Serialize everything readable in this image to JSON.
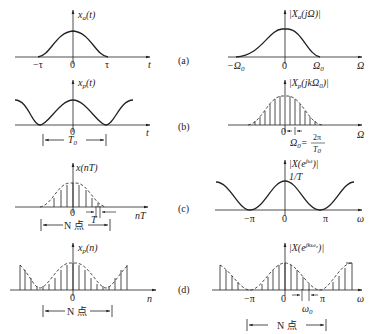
{
  "figure": {
    "panel_tags": [
      "(a)",
      "(b)",
      "(c)",
      "(d)"
    ],
    "colors": {
      "ink": "#222222",
      "background": "#ffffff"
    }
  },
  "panels": {
    "a_left": {
      "ylabel": "x",
      "ylabel_sub": "a",
      "ylabel_arg": "(t)",
      "xlabel": "t",
      "ticks": [
        "−τ",
        "0",
        "τ"
      ]
    },
    "a_right": {
      "ylabel": "|X",
      "ylabel_sub": "a",
      "ylabel_arg": "(jΩ)|",
      "xlabel": "Ω",
      "ticks": [
        "−Ω",
        "0",
        "Ω"
      ],
      "tick_sub": "0"
    },
    "b_left": {
      "ylabel": "x",
      "ylabel_sub": "p",
      "ylabel_arg": "(t)",
      "xlabel": "t",
      "ticks": [
        "0"
      ],
      "period_label": "T",
      "period_sub": "0"
    },
    "b_right": {
      "ylabel": "|X",
      "ylabel_sub": "p",
      "ylabel_arg": "(jkΩ",
      "ylabel_arg_sub": "0",
      "ylabel_close": ")|",
      "xlabel": "Ω",
      "ticks": [
        "0"
      ],
      "spacing_label": "Ω",
      "spacing_sub": "0",
      "spacing_eq": "=",
      "frac_num": "2π",
      "frac_den": "T",
      "frac_den_sub": "0"
    },
    "c_left": {
      "ylabel": "x(nT)",
      "xlabel": "nT",
      "ticks": [
        "0"
      ],
      "sample_spacing": "T",
      "bracket_label": "N 点"
    },
    "c_right": {
      "ylabel": "|X(e",
      "ylabel_sup": "jω",
      "ylabel_close": ")|",
      "peak_label": "1/T",
      "xlabel": "ω",
      "ticks": [
        "−π",
        "0",
        "π"
      ]
    },
    "d_left": {
      "ylabel": "x",
      "ylabel_sub": "p",
      "ylabel_arg": "(n)",
      "xlabel": "n",
      "ticks": [
        "0"
      ],
      "bracket_label": "N 点"
    },
    "d_right": {
      "ylabel": "|X(e",
      "ylabel_sup": "jkω₀",
      "ylabel_close": ")|",
      "xlabel": "ω",
      "ticks": [
        "−π",
        "0",
        "π"
      ],
      "spacing_label": "ω",
      "spacing_sub": "0",
      "bracket_label": "N 点"
    }
  }
}
